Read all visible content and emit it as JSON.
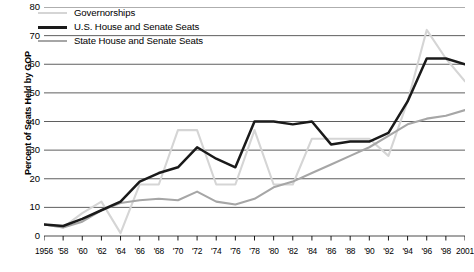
{
  "chart_data": {
    "type": "line",
    "title": "",
    "xlabel": "",
    "ylabel": "Percent of Seats Held by GOP",
    "ylim": [
      0,
      80
    ],
    "ytick_values": [
      0,
      10,
      20,
      30,
      40,
      50,
      60,
      70,
      80
    ],
    "ytick_labels": [
      "0",
      "10",
      "20",
      "30",
      "40",
      "50",
      "60",
      "70",
      "80"
    ],
    "grid": true,
    "legend_position": "top-left",
    "xlim": [
      1956,
      2001
    ],
    "x": [
      1956,
      1958,
      1960,
      1962,
      1964,
      1966,
      1968,
      1970,
      1972,
      1974,
      1976,
      1978,
      1980,
      1982,
      1984,
      1986,
      1988,
      1990,
      1992,
      1994,
      1996,
      1998,
      2001
    ],
    "xtick_labels": [
      "1956",
      "'58",
      "'60",
      "'62",
      "'64",
      "'66",
      "'68",
      "'70",
      "'72",
      "'74",
      "'76",
      "'78",
      "'80",
      "'82",
      "'84",
      "'86",
      "'88",
      "'90",
      "'92",
      "'94",
      "'96",
      "'98",
      "2001"
    ],
    "series": [
      {
        "name": "Governorships",
        "color": "#d5d5d5",
        "width": 2.1,
        "values": [
          4,
          3,
          8,
          12,
          1,
          18,
          18,
          37,
          37,
          18,
          18,
          37,
          18,
          18,
          34,
          34,
          34,
          34,
          28,
          47,
          72,
          62,
          54
        ]
      },
      {
        "name": "U.S. House and Senate Seats",
        "color": "#1a1a1a",
        "width": 2.5,
        "values": [
          4,
          3.5,
          6,
          9,
          12,
          19,
          22,
          24,
          31,
          27,
          24,
          40,
          40,
          39,
          40,
          32,
          33,
          33,
          36,
          47,
          62,
          62,
          60
        ]
      },
      {
        "name": "State House and Senate Seats",
        "color": "#a6a6a6",
        "width": 2.1,
        "values": [
          4,
          3,
          5,
          9,
          11.5,
          12.5,
          13,
          12.5,
          15.5,
          12,
          11,
          13,
          17,
          19,
          22,
          25,
          28,
          31,
          35,
          39,
          41,
          42,
          44
        ]
      }
    ]
  },
  "legend": {
    "items": [
      {
        "label": "Governorships"
      },
      {
        "label": "U.S. House and Senate Seats"
      },
      {
        "label": "State House and Senate Seats"
      }
    ]
  },
  "caption": {
    "text": ""
  }
}
